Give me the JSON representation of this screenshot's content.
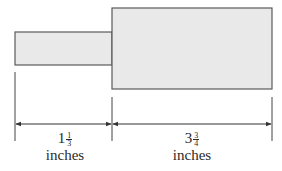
{
  "diagram": {
    "shapes": [
      {
        "name": "small-rectangle",
        "x": 15,
        "y": 32,
        "width": 97,
        "height": 33,
        "fill": "#e9e9e9",
        "stroke": "#5a5a5a"
      },
      {
        "name": "large-rectangle",
        "x": 112,
        "y": 8,
        "width": 160,
        "height": 81,
        "fill": "#e9e9e9",
        "stroke": "#5a5a5a"
      }
    ],
    "dimensions": [
      {
        "name": "left-dimension",
        "whole": "1",
        "numerator": "1",
        "denominator": "3",
        "unit": "inches"
      },
      {
        "name": "right-dimension",
        "whole": "3",
        "numerator": "3",
        "denominator": "4",
        "unit": "inches"
      }
    ]
  }
}
